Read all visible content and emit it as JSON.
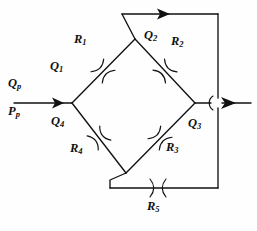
{
  "figure": {
    "type": "hydraulic-bridge-network-diagram",
    "background_color": "#fefefe",
    "line_color": "#111111"
  },
  "labels": {
    "inlet_flow": {
      "base": "Q",
      "sub": "p"
    },
    "inlet_pressure": {
      "base": "P",
      "sub": "p"
    },
    "q1": {
      "base": "Q",
      "sub": "1"
    },
    "q2": {
      "base": "Q",
      "sub": "2"
    },
    "q3": {
      "base": "Q",
      "sub": "3"
    },
    "q4": {
      "base": "Q",
      "sub": "4"
    },
    "r1": {
      "base": "R",
      "sub": "1"
    },
    "r2": {
      "base": "R",
      "sub": "2"
    },
    "r3": {
      "base": "R",
      "sub": "3"
    },
    "r4": {
      "base": "R",
      "sub": "4"
    },
    "r5": {
      "base": "R",
      "sub": "5"
    }
  },
  "nodes": {
    "left": {
      "x": 72,
      "y": 103
    },
    "top": {
      "x": 135,
      "y": 39
    },
    "right": {
      "x": 195,
      "y": 103
    },
    "bottom": {
      "x": 126,
      "y": 173
    }
  },
  "branches": [
    {
      "name": "branch-r1",
      "from": "left",
      "to": "top",
      "flow": "Q1",
      "resistance": "R1"
    },
    {
      "name": "branch-r2",
      "from": "top",
      "to": "right",
      "flow": "Q2",
      "resistance": "R2"
    },
    {
      "name": "branch-r3",
      "from": "bottom",
      "to": "right",
      "flow": "Q3",
      "resistance": "R3"
    },
    {
      "name": "branch-r4",
      "from": "left",
      "to": "bottom",
      "flow": "Q4",
      "resistance": "R4"
    },
    {
      "name": "branch-r5",
      "from": "top",
      "to": "bottom",
      "flow": "",
      "resistance": "R5",
      "route": "bypass-right-loop"
    }
  ],
  "arrows": [
    {
      "name": "inlet-arrow",
      "direction": "right",
      "x": 62,
      "y": 103
    },
    {
      "name": "top-arrow",
      "direction": "right",
      "x": 168,
      "y": 14
    },
    {
      "name": "outlet-arrow",
      "direction": "right",
      "x": 232,
      "y": 103
    }
  ],
  "label_positions": {
    "inlet_flow": {
      "x": 8,
      "y": 84
    },
    "inlet_pressure": {
      "x": 8,
      "y": 112
    },
    "q1": {
      "x": 50,
      "y": 67
    },
    "q2": {
      "x": 147,
      "y": 36
    },
    "q3": {
      "x": 190,
      "y": 124
    },
    "q4": {
      "x": 52,
      "y": 122
    },
    "r1": {
      "x": 75,
      "y": 40
    },
    "r2": {
      "x": 172,
      "y": 42
    },
    "r3": {
      "x": 168,
      "y": 148
    },
    "r4": {
      "x": 71,
      "y": 149
    },
    "r5": {
      "x": 148,
      "y": 207
    }
  }
}
